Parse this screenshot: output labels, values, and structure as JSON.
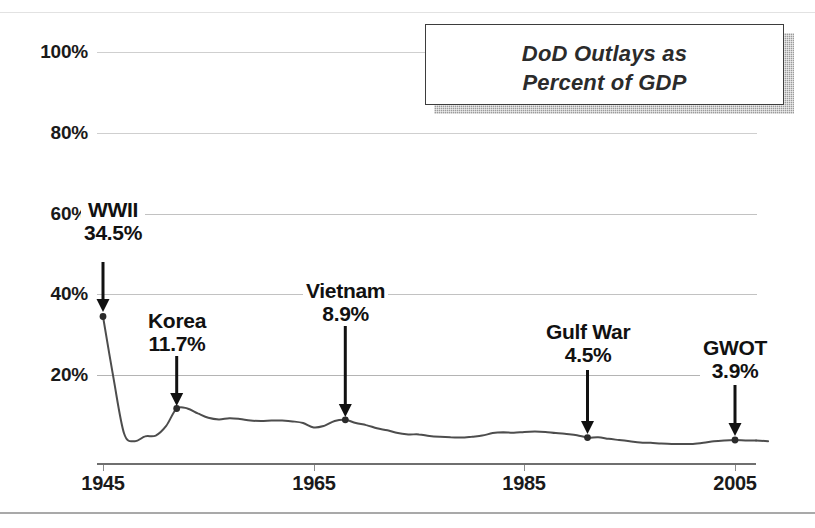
{
  "title": {
    "line1": "DoD Outlays as",
    "line2": "Percent of GDP"
  },
  "chart_data": {
    "type": "line",
    "title": "DoD Outlays as Percent of GDP",
    "xlabel": "",
    "ylabel": "",
    "xlim": [
      1945,
      2008
    ],
    "ylim": [
      0,
      110
    ],
    "grid": true,
    "legend": false,
    "y_ticks": [
      "100%",
      "80%",
      "60%",
      "40%",
      "20%"
    ],
    "y_tick_values": [
      100,
      80,
      60,
      40,
      20
    ],
    "x_ticks": [
      "1945",
      "1965",
      "1985",
      "2005"
    ],
    "x_tick_values": [
      1945,
      1965,
      1985,
      2005
    ],
    "series": [
      {
        "name": "DoD Outlays as Percent of GDP",
        "x": [
          1945,
          1946,
          1947,
          1948,
          1949,
          1950,
          1951,
          1952,
          1953,
          1954,
          1955,
          1956,
          1957,
          1958,
          1959,
          1960,
          1961,
          1962,
          1963,
          1964,
          1965,
          1966,
          1967,
          1968,
          1969,
          1970,
          1971,
          1972,
          1973,
          1974,
          1975,
          1976,
          1977,
          1978,
          1979,
          1980,
          1981,
          1982,
          1983,
          1984,
          1985,
          1986,
          1987,
          1988,
          1989,
          1990,
          1991,
          1992,
          1993,
          1994,
          1995,
          1996,
          1997,
          1998,
          1999,
          2000,
          2001,
          2002,
          2003,
          2004,
          2005,
          2006,
          2007
        ],
        "values": [
          34.5,
          19.2,
          5.5,
          3.6,
          4.8,
          5.0,
          7.4,
          11.7,
          11.7,
          10.5,
          9.4,
          9.0,
          9.3,
          9.1,
          8.7,
          8.6,
          8.7,
          8.7,
          8.5,
          8.1,
          7.0,
          7.4,
          8.6,
          8.9,
          8.1,
          7.6,
          6.8,
          6.3,
          5.6,
          5.3,
          5.3,
          4.9,
          4.7,
          4.6,
          4.5,
          4.7,
          5.0,
          5.6,
          5.8,
          5.7,
          5.9,
          6.0,
          5.9,
          5.6,
          5.4,
          5.1,
          4.5,
          4.6,
          4.2,
          3.9,
          3.6,
          3.3,
          3.2,
          3.0,
          2.9,
          2.9,
          2.9,
          3.2,
          3.6,
          3.8,
          3.9,
          3.8,
          3.8
        ]
      }
    ],
    "annotations": [
      {
        "label": "WWII",
        "value": "34.5%",
        "year": 1945,
        "y_value": 34.5
      },
      {
        "label": "Korea",
        "value": "11.7%",
        "year": 1952,
        "y_value": 11.7
      },
      {
        "label": "Vietnam",
        "value": "8.9%",
        "year": 1968,
        "y_value": 8.9
      },
      {
        "label": "Gulf War",
        "value": "4.5%",
        "year": 1991,
        "y_value": 4.5
      },
      {
        "label": "GWOT",
        "value": "3.9%",
        "year": 2005,
        "y_value": 3.9
      }
    ],
    "colors": {
      "line": "#4d4d4d",
      "marker": "#2b2b2b",
      "gridline": "#c2c2c2",
      "axis": "#6f6f6f",
      "text": "#1a1a1a"
    }
  }
}
